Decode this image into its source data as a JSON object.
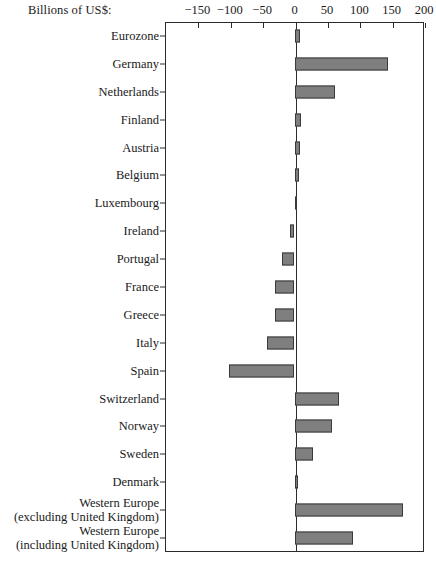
{
  "chart_data": {
    "type": "bar",
    "orientation": "horizontal",
    "title": "",
    "xlabel": "Billions of US$:",
    "ylabel": "",
    "xlim": [
      -200,
      200
    ],
    "xticks": [
      -150,
      -100,
      -50,
      0,
      50,
      100,
      150,
      200
    ],
    "xtick_labels": [
      "−150",
      "−100",
      "−50",
      "0",
      "50",
      "100",
      "150",
      "200"
    ],
    "grid": false,
    "legend": null,
    "bar_color": "#7f7f7f",
    "bar_edge_color": "#3a3a3a",
    "frame_color": "#2b2b2b",
    "categories": [
      "Eurozone",
      "Germany",
      "Netherlands",
      "Finland",
      "Austria",
      "Belgium",
      "Luxembourg",
      "Ireland",
      "Portugal",
      "France",
      "Greece",
      "Italy",
      "Spain",
      "Switzerland",
      "Norway",
      "Sweden",
      "Denmark",
      "Western Europe (excluding United Kingdom)",
      "Western Europe (including United Kingdom)"
    ],
    "category_lines": [
      [
        "Eurozone"
      ],
      [
        "Germany"
      ],
      [
        "Netherlands"
      ],
      [
        "Finland"
      ],
      [
        "Austria"
      ],
      [
        "Belgium"
      ],
      [
        "Luxembourg"
      ],
      [
        "Ireland"
      ],
      [
        "Portugal"
      ],
      [
        "France"
      ],
      [
        "Greece"
      ],
      [
        "Italy"
      ],
      [
        "Spain"
      ],
      [
        "Switzerland"
      ],
      [
        "Norway"
      ],
      [
        "Sweden"
      ],
      [
        "Denmark"
      ],
      [
        "Western Europe",
        "(excluding United Kingdom)"
      ],
      [
        "Western Europe",
        "(including United Kingdom)"
      ]
    ],
    "values": [
      8,
      144,
      62,
      10,
      8,
      7,
      2,
      -7,
      -19,
      -30,
      -30,
      -43,
      -101,
      68,
      58,
      29,
      5,
      168,
      90
    ]
  }
}
